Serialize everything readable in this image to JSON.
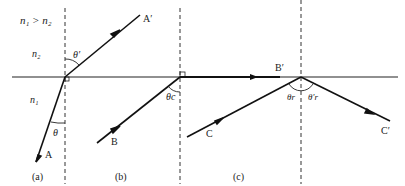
{
  "condition": "n₁ > n₂",
  "media": {
    "upper": "n₂",
    "lower": "n₁"
  },
  "panels": [
    {
      "label": "(a)",
      "incident_ray": "A",
      "refracted_ray": "A′",
      "incident_angle": "θ",
      "refracted_angle": "θ′"
    },
    {
      "label": "(b)",
      "incident_ray": "B",
      "refracted_ray": "B′",
      "incident_angle": "θc"
    },
    {
      "label": "(c)",
      "incident_ray": "C",
      "reflected_ray": "C′",
      "incident_angle": "θr",
      "reflected_angle": "θ′r"
    }
  ],
  "colors": {
    "line": "#111111",
    "interface": "#222222",
    "normal": "#333333"
  }
}
